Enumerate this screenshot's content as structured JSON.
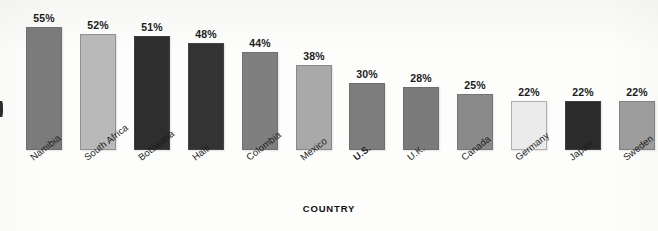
{
  "chart_data": {
    "type": "bar",
    "title": "",
    "subtitle": "",
    "xlabel": "COUNTRY",
    "ylabel": "",
    "ylim": [
      0,
      60
    ],
    "grid": false,
    "legend": null,
    "value_suffix": "%",
    "categories": [
      "Namibia",
      "South Africa",
      "Botswana",
      "Haiti",
      "Colombia",
      "Mexico",
      "U.S.",
      "U.K.",
      "Canada",
      "Germany",
      "Japan",
      "Sweden"
    ],
    "values": [
      55,
      52,
      51,
      48,
      44,
      38,
      30,
      28,
      25,
      22,
      22,
      22
    ],
    "data_labels": [
      "55%",
      "52%",
      "51%",
      "48%",
      "44%",
      "38%",
      "30%",
      "28%",
      "25%",
      "22%",
      "22%",
      "22%"
    ],
    "bar_colors": [
      "#7b7b7b",
      "#b9b9b9",
      "#2e2e2e",
      "#333333",
      "#7f7f7f",
      "#a9a9a9",
      "#7d7d7d",
      "#7a7a7a",
      "#8a8a8a",
      "#ebebeb",
      "#2b2b2b",
      "#9d9d9d"
    ],
    "highlighted_category": "U.S."
  },
  "axis": {
    "x_title": "COUNTRY"
  },
  "bars": [
    {
      "label": "Namibia",
      "value_text": "55%"
    },
    {
      "label": "South Africa",
      "value_text": "52%"
    },
    {
      "label": "Botswana",
      "value_text": "51%"
    },
    {
      "label": "Haiti",
      "value_text": "48%"
    },
    {
      "label": "Colombia",
      "value_text": "44%"
    },
    {
      "label": "Mexico",
      "value_text": "38%"
    },
    {
      "label": "U.S.",
      "value_text": "30%"
    },
    {
      "label": "U.K.",
      "value_text": "28%"
    },
    {
      "label": "Canada",
      "value_text": "25%"
    },
    {
      "label": "Germany",
      "value_text": "22%"
    },
    {
      "label": "Japan",
      "value_text": "22%"
    },
    {
      "label": "Sweden",
      "value_text": "22%"
    }
  ]
}
